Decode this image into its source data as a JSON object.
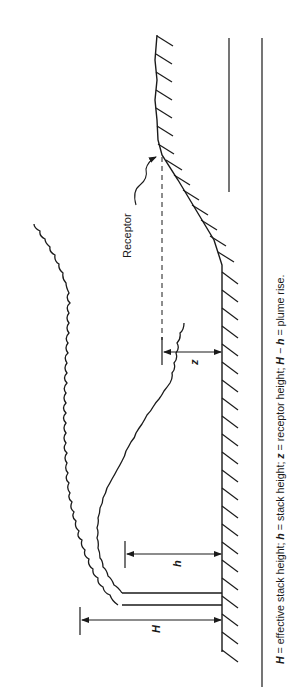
{
  "figure": {
    "orientation": "rotated-90-ccw",
    "labels": {
      "receptor": "Receptor",
      "H": "H",
      "h": "h",
      "z": "z"
    },
    "caption": {
      "H_sym": "H",
      "H_def": " = effective stack height; ",
      "h_sym": "h",
      "h_def": " = stack height; ",
      "z_sym": "z",
      "z_def": " = receptor height; ",
      "H2_sym": "H",
      "minus": " − ",
      "h2_sym": "h",
      "rise_def": " = plume rise."
    },
    "colors": {
      "ink": "#1a1a1a",
      "background": "#ffffff"
    }
  }
}
